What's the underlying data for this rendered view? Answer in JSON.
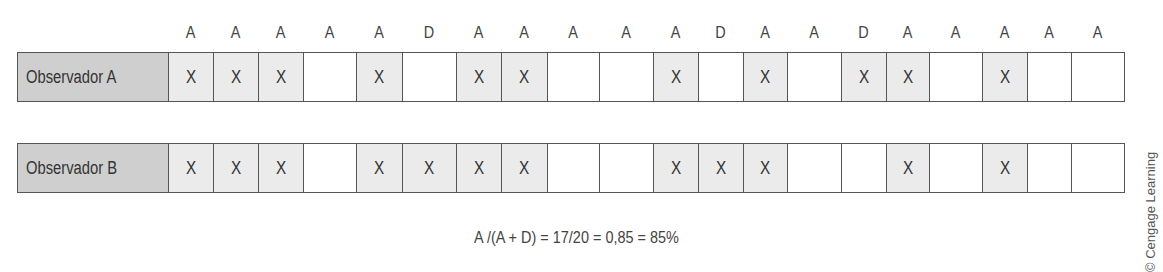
{
  "header_letters": [
    "A",
    "A",
    "A",
    "A",
    "A",
    "D",
    "A",
    "A",
    "A",
    "A",
    "A",
    "D",
    "A",
    "A",
    "D",
    "A",
    "A",
    "A",
    "A",
    "A"
  ],
  "rows": [
    {
      "label": "Observador A",
      "cells": [
        "X",
        "X",
        "X",
        "",
        "X",
        "",
        "X",
        "X",
        "",
        "",
        "X",
        "",
        "X",
        "",
        "X",
        "X",
        "",
        "X",
        "",
        ""
      ]
    },
    {
      "label": "Observador B",
      "cells": [
        "X",
        "X",
        "X",
        "",
        "X",
        "X",
        "X",
        "X",
        "",
        "",
        "X",
        "X",
        "X",
        "",
        "",
        "X",
        "",
        "X",
        "",
        ""
      ]
    }
  ],
  "formula": "A /(A + D) = 17/20 = 0,85 = 85%",
  "credit": "© Cengage Learning",
  "colors": {
    "label_bg": "#cfcfcf",
    "marked_cell_bg": "#ebebeb",
    "border": "#555555"
  }
}
